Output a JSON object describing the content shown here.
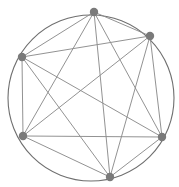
{
  "figure": {
    "type": "node-link-diagram",
    "width": 179,
    "height": 187,
    "background_color": "#ffffff"
  },
  "chart_data": {
    "type": "graph",
    "layout": "circular",
    "node_count": 6,
    "edge_count": 15,
    "complete_graph": true,
    "boundary_circle": {
      "center_x": 91,
      "center_y": 98,
      "radius": 83,
      "stroke_color": "#6f6f6f",
      "stroke_width": 1.1,
      "visible": true
    },
    "node_style": {
      "fill_color": "#7a7a7a",
      "radius": 4.2,
      "shape": "circle"
    },
    "edge_style": {
      "stroke_color": "#8c8c8c",
      "stroke_width": 0.95
    },
    "nodes": [
      {
        "id": "n0",
        "label": "0",
        "x": 94,
        "y": 12
      },
      {
        "id": "n1",
        "label": "1",
        "x": 150,
        "y": 36
      },
      {
        "id": "n2",
        "label": "2",
        "x": 162,
        "y": 137
      },
      {
        "id": "n3",
        "label": "3",
        "x": 110,
        "y": 177
      },
      {
        "id": "n4",
        "label": "4",
        "x": 23,
        "y": 136
      },
      {
        "id": "n5",
        "label": "5",
        "x": 22,
        "y": 57
      }
    ],
    "edges": [
      {
        "source": "n0",
        "target": "n1"
      },
      {
        "source": "n0",
        "target": "n2"
      },
      {
        "source": "n0",
        "target": "n3"
      },
      {
        "source": "n0",
        "target": "n4"
      },
      {
        "source": "n0",
        "target": "n5"
      },
      {
        "source": "n1",
        "target": "n2"
      },
      {
        "source": "n1",
        "target": "n3"
      },
      {
        "source": "n1",
        "target": "n4"
      },
      {
        "source": "n1",
        "target": "n5"
      },
      {
        "source": "n2",
        "target": "n3"
      },
      {
        "source": "n2",
        "target": "n4"
      },
      {
        "source": "n2",
        "target": "n5"
      },
      {
        "source": "n3",
        "target": "n4"
      },
      {
        "source": "n3",
        "target": "n5"
      },
      {
        "source": "n4",
        "target": "n5"
      }
    ]
  }
}
